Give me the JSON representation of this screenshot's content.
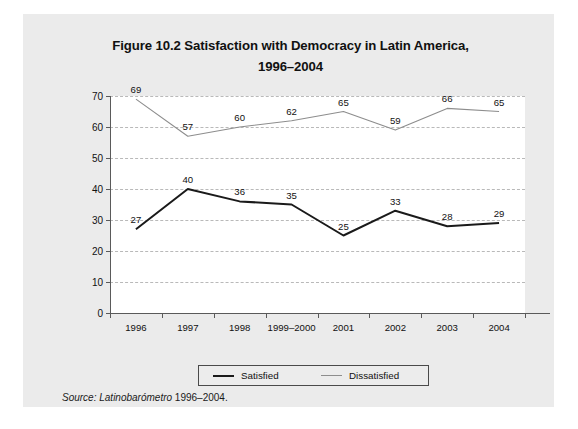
{
  "figure": {
    "title_line1": "Figure 10.2 Satisfaction with Democracy in Latin America,",
    "title_line2": "1996–2004",
    "source_label": "Source:",
    "source_org": "Latinobarómetro",
    "source_years": "1996–2004.",
    "panel_bg": "#ebebeb",
    "plot_bg": "#ffffff"
  },
  "legend": {
    "items": [
      {
        "label": "Satisfied",
        "color": "#1a1a1a"
      },
      {
        "label": "Dissatisfied",
        "color": "#8d8d8d"
      }
    ]
  },
  "chart_data": {
    "type": "line",
    "title": "Figure 10.2 Satisfaction with Democracy in Latin America, 1996–2004",
    "xlabel": "",
    "ylabel": "",
    "categories": [
      "1996",
      "1997",
      "1998",
      "1999–2000",
      "2001",
      "2002",
      "2003",
      "2004"
    ],
    "series": [
      {
        "name": "Satisfied",
        "color": "#1a1a1a",
        "values": [
          27,
          40,
          36,
          35,
          25,
          33,
          28,
          29
        ]
      },
      {
        "name": "Dissatisfied",
        "color": "#8d8d8d",
        "values": [
          69,
          57,
          60,
          62,
          65,
          59,
          66,
          65
        ]
      }
    ],
    "ylim": [
      0,
      70
    ],
    "yticks": [
      0,
      10,
      20,
      30,
      40,
      50,
      60,
      70
    ],
    "grid": "horizontal-dashed",
    "legend_position": "bottom",
    "data_labels": true
  }
}
